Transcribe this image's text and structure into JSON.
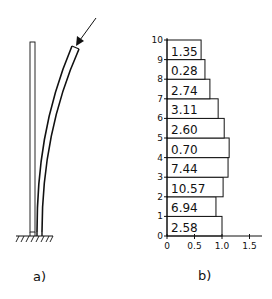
{
  "panels": {
    "a": {
      "label": "a)"
    },
    "b": {
      "label": "b)"
    }
  },
  "chart_data": {
    "type": "bar",
    "orientation": "horizontal",
    "title": "",
    "xlabel": "",
    "ylabel": "",
    "xlim": [
      0,
      1.7
    ],
    "ylim": [
      0,
      10
    ],
    "x_ticks": [
      "0",
      "0.5",
      "1.0",
      "1.5"
    ],
    "x_tick_values": [
      0,
      0.5,
      1.0,
      1.5
    ],
    "y_ticks": [
      "0",
      "1",
      "2",
      "3",
      "4",
      "5",
      "6",
      "7",
      "8",
      "9",
      "10"
    ],
    "segments": [
      {
        "from": 0,
        "to": 1,
        "width": 1.0,
        "label": "2.58"
      },
      {
        "from": 1,
        "to": 2,
        "width": 0.89,
        "label": "6.94"
      },
      {
        "from": 2,
        "to": 3,
        "width": 1.02,
        "label": "10.57"
      },
      {
        "from": 3,
        "to": 4,
        "width": 1.11,
        "label": "7.44"
      },
      {
        "from": 4,
        "to": 5,
        "width": 1.13,
        "label": "0.70"
      },
      {
        "from": 5,
        "to": 6,
        "width": 1.04,
        "label": "2.60"
      },
      {
        "from": 6,
        "to": 7,
        "width": 0.93,
        "label": "3.11"
      },
      {
        "from": 7,
        "to": 8,
        "width": 0.78,
        "label": "2.74"
      },
      {
        "from": 8,
        "to": 9,
        "width": 0.69,
        "label": "0.28"
      },
      {
        "from": 9,
        "to": 10,
        "width": 0.62,
        "label": "1.35"
      }
    ],
    "grid": false,
    "legend": null
  },
  "colors": {
    "ink": "#111111",
    "background": "#ffffff"
  }
}
